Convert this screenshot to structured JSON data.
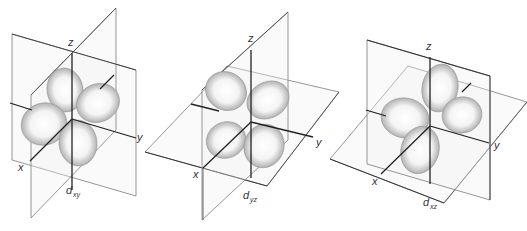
{
  "figure": {
    "panels": [
      {
        "id": "dxy",
        "axes": {
          "z": "z",
          "x": "x",
          "y": "y"
        },
        "label_main": "d",
        "label_sub": "xy"
      },
      {
        "id": "dyz",
        "axes": {
          "z": "z",
          "x": "x",
          "y": "y"
        },
        "label_main": "d",
        "label_sub": "yz"
      },
      {
        "id": "dxz",
        "axes": {
          "z": "z",
          "x": "x",
          "y": "y"
        },
        "label_main": "d",
        "label_sub": "xz"
      }
    ],
    "colors": {
      "lobe_center": "#ffffff",
      "lobe_edge": "#8c8c8c",
      "axis": "#222222",
      "plane": "#8a8a8a"
    }
  }
}
